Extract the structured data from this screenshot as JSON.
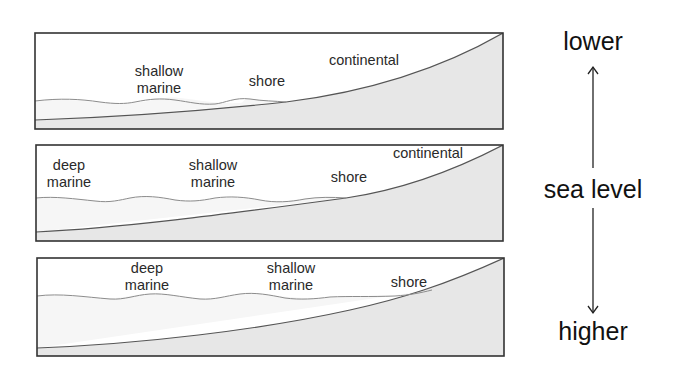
{
  "figure": {
    "colors": {
      "background": "#ffffff",
      "frame": "#333333",
      "land_fill": "#e6e6e6",
      "water_fill": "#f5f5f5",
      "sea_surface_line": "#8a8a8a",
      "seafloor_line": "#444444",
      "text": "#2a2a2a"
    }
  },
  "panels": [
    {
      "id": "panel-1",
      "sea_level": "lower",
      "labels": {
        "shallow_marine_line1": "shallow",
        "shallow_marine_line2": "marine",
        "shore": "shore",
        "continental": "continental"
      }
    },
    {
      "id": "panel-2",
      "sea_level": "intermediate",
      "labels": {
        "deep_marine_line1": "deep",
        "deep_marine_line2": "marine",
        "shallow_marine_line1": "shallow",
        "shallow_marine_line2": "marine",
        "shore": "shore",
        "continental": "continental"
      }
    },
    {
      "id": "panel-3",
      "sea_level": "higher",
      "labels": {
        "deep_marine_line1": "deep",
        "deep_marine_line2": "marine",
        "shallow_marine_line1": "shallow",
        "shallow_marine_line2": "marine",
        "shore": "shore"
      }
    }
  ],
  "scale": {
    "top_label": "lower",
    "middle_label": "sea level",
    "bottom_label": "higher",
    "arrow": "double-headed vertical arrow"
  }
}
